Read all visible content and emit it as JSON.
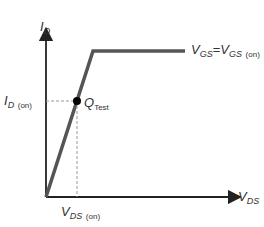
{
  "diagram": {
    "y_axis": {
      "label_main": "I",
      "label_sub": "D"
    },
    "x_axis": {
      "label_main": "V",
      "label_sub": "DS"
    },
    "curve_label": {
      "left_main": "V",
      "left_sub": "GS",
      "eq": "=",
      "right_main": "V",
      "right_sub": "GS",
      "right_note": "(on)"
    },
    "id_on_label": {
      "main": "I",
      "sub": "D",
      "note": "(on)"
    },
    "vds_on_label": {
      "main": "V",
      "sub": "DS",
      "note": "(on)"
    },
    "point_label": {
      "main": "Q",
      "sub": "Test"
    },
    "colors": {
      "axis": "#222222",
      "curve": "#555555",
      "dash": "#999999",
      "point": "#000000"
    }
  }
}
